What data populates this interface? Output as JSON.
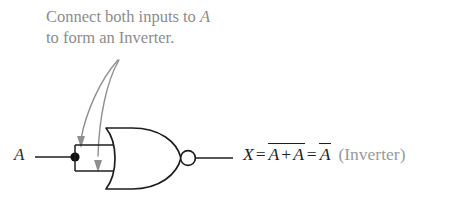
{
  "annotation": {
    "line1_pre": "Connect both inputs to ",
    "line1_var": "A",
    "line2": "to form an Inverter."
  },
  "circuit": {
    "gate_type": "NOR",
    "input_label": "A",
    "output_label": "X",
    "junction_dot": true,
    "inverting_bubble": true,
    "arrow_count": 2
  },
  "expression": {
    "output_var": "X",
    "equals_1": "=",
    "nor_term_a": "A",
    "plus": "+",
    "nor_term_b": "A",
    "equals_2": "=",
    "result_var": "A",
    "result_note": "(Inverter)",
    "full_text": "X = ~(A + A) = ~A (Inverter)"
  },
  "colors": {
    "annotation_gray": "#8c8c8c",
    "wire_black": "#1e1e1e",
    "arrow_gray": "#8f8f8f",
    "note_gray": "#9a9a9a",
    "background": "#ffffff"
  }
}
